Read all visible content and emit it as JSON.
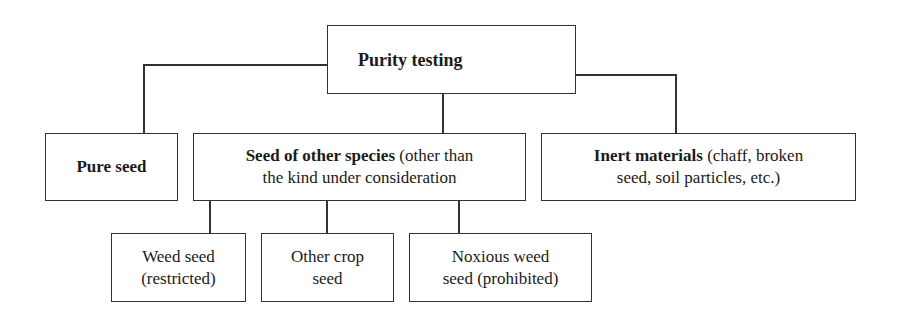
{
  "diagram": {
    "root": {
      "label": "Purity testing"
    },
    "level1": [
      {
        "bold": "Pure seed",
        "rest": ""
      },
      {
        "bold": "Seed of other species",
        "rest_line1": " (other than",
        "rest_line2": "the kind under consideration"
      },
      {
        "bold": "Inert materials",
        "rest_line1": " (chaff, broken",
        "rest_line2": "seed, soil particles, etc.)"
      }
    ],
    "level2": [
      {
        "line1": "Weed seed",
        "line2": "(restricted)"
      },
      {
        "line1": "Other crop",
        "line2": "seed"
      },
      {
        "line1": "Noxious weed",
        "line2": "seed (prohibited)"
      }
    ]
  }
}
